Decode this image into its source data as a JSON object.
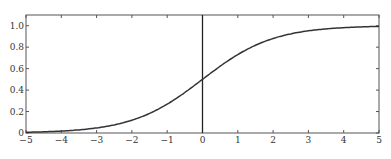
{
  "chart_data": {
    "type": "line",
    "title": "",
    "xlabel": "",
    "ylabel": "",
    "xlim": [
      -5,
      5
    ],
    "ylim": [
      0,
      1.1
    ],
    "grid": false,
    "x_ticks": [
      "-5",
      "-4",
      "-3",
      "-2",
      "-1",
      "0",
      "1",
      "2",
      "3",
      "4",
      "5"
    ],
    "y_ticks": [
      "0",
      "0.2",
      "0.4",
      "0.6",
      "0.8",
      "1.0"
    ],
    "annotations": [
      "vertical line at x = 0"
    ],
    "series": [
      {
        "name": "sigmoid",
        "x": [
          -5,
          -4,
          -3,
          -2,
          -1,
          0,
          1,
          2,
          3,
          4,
          5
        ],
        "values": [
          0.007,
          0.018,
          0.047,
          0.119,
          0.269,
          0.5,
          0.731,
          0.881,
          0.953,
          0.982,
          0.993
        ]
      }
    ]
  }
}
